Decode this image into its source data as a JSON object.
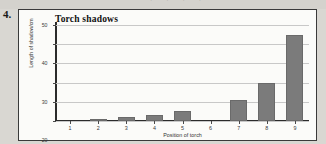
{
  "question_number": "4.",
  "bleed_text": "·   ·  ·     ·",
  "chart_data": {
    "type": "bar",
    "title": "Torch shadows",
    "xlabel": "Position of torch",
    "ylabel": "Length of shadow/cm",
    "categories": [
      "1",
      "2",
      "3",
      "4",
      "5",
      "6",
      "7",
      "8",
      "9"
    ],
    "values": [
      0,
      1,
      2,
      3,
      5,
      0,
      11,
      20,
      45
    ],
    "ylim": [
      0,
      50
    ],
    "yticks": [
      0,
      10,
      20,
      30,
      40,
      50
    ],
    "ytick_labels": [
      "0",
      "10",
      "20",
      "30",
      "40",
      "50"
    ],
    "grid": true,
    "legend": "none",
    "bar_color": "#7b7b7b",
    "grid_color": "#c8c8c8",
    "axis_color": "#2b2b2b",
    "plot_background": "#fbfbf9"
  }
}
